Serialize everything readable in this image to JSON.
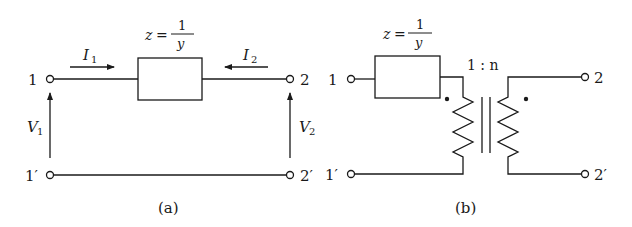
{
  "diagram_a": {
    "caption": "(a)",
    "impedance_label": {
      "lhs": "z",
      "eq": "=",
      "num": "1",
      "den": "y"
    },
    "terminals": {
      "t1": "1",
      "t1p": "1′",
      "t2": "2",
      "t2p": "2′"
    },
    "currents": {
      "i1": "I",
      "i1_sub": "1",
      "i2": "I",
      "i2_sub": "2"
    },
    "voltages": {
      "v1": "V",
      "v1_sub": "1",
      "v2": "V",
      "v2_sub": "2"
    }
  },
  "diagram_b": {
    "caption": "(b)",
    "impedance_label": {
      "lhs": "z",
      "eq": "=",
      "num": "1",
      "den": "y"
    },
    "terminals": {
      "t1": "1",
      "t1p": "1′",
      "t2": "2",
      "t2p": "2′"
    },
    "transformer_ratio": "1 : n"
  },
  "colors": {
    "stroke": "#1a1a1a",
    "background": "#ffffff"
  }
}
